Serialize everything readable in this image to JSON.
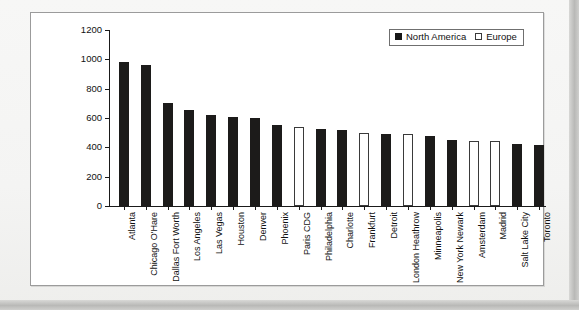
{
  "figure": {
    "background_color": "#ffffff",
    "frame_border_color": "#9b9b9b",
    "na_color": "#1c1b1a",
    "eu_color": "#ffffff"
  },
  "legend": {
    "position": "top-right",
    "entries": [
      {
        "label": "North America",
        "swatch": "filled-black-square"
      },
      {
        "label": "Europe",
        "swatch": "open-white-square"
      }
    ]
  },
  "chart_data": {
    "type": "bar",
    "title": "",
    "xlabel": "",
    "ylabel": "Air transport movements (000s)",
    "ylim": [
      0,
      1200
    ],
    "yticks": [
      0,
      200,
      400,
      600,
      800,
      1000,
      1200
    ],
    "grid": false,
    "legend_position": "top-right",
    "categories": [
      "Atlanta",
      "Chicago O'Hare",
      "Dallas Fort Worth",
      "Los Angeles",
      "Las Vegas",
      "Houston",
      "Denver",
      "Phoenix",
      "Paris CDG",
      "Philadelphia",
      "Charlotte",
      "Frankfurt",
      "Detroit",
      "London Heathrow",
      "Minneapolis",
      "New York Newark",
      "Amsterdam",
      "Madrid",
      "Salt Lake City",
      "Toronto"
    ],
    "values": [
      980,
      960,
      700,
      655,
      620,
      605,
      600,
      550,
      540,
      525,
      515,
      500,
      490,
      490,
      480,
      450,
      445,
      445,
      420,
      418
    ],
    "groups": [
      "North America",
      "North America",
      "North America",
      "North America",
      "North America",
      "North America",
      "North America",
      "North America",
      "Europe",
      "North America",
      "North America",
      "Europe",
      "North America",
      "Europe",
      "North America",
      "North America",
      "Europe",
      "Europe",
      "North America",
      "North America"
    ],
    "series": [
      {
        "name": "North America",
        "color": "#1c1b1a",
        "points": [
          {
            "category": "Atlanta",
            "value": 980
          },
          {
            "category": "Chicago O'Hare",
            "value": 960
          },
          {
            "category": "Dallas Fort Worth",
            "value": 700
          },
          {
            "category": "Los Angeles",
            "value": 655
          },
          {
            "category": "Las Vegas",
            "value": 620
          },
          {
            "category": "Houston",
            "value": 605
          },
          {
            "category": "Denver",
            "value": 600
          },
          {
            "category": "Phoenix",
            "value": 550
          },
          {
            "category": "Philadelphia",
            "value": 525
          },
          {
            "category": "Charlotte",
            "value": 515
          },
          {
            "category": "Detroit",
            "value": 490
          },
          {
            "category": "Minneapolis",
            "value": 480
          },
          {
            "category": "New York Newark",
            "value": 450
          },
          {
            "category": "Salt Lake City",
            "value": 420
          },
          {
            "category": "Toronto",
            "value": 418
          }
        ]
      },
      {
        "name": "Europe",
        "color": "#ffffff",
        "points": [
          {
            "category": "Paris CDG",
            "value": 540
          },
          {
            "category": "Frankfurt",
            "value": 500
          },
          {
            "category": "London Heathrow",
            "value": 490
          },
          {
            "category": "Amsterdam",
            "value": 445
          },
          {
            "category": "Madrid",
            "value": 445
          }
        ]
      }
    ]
  }
}
